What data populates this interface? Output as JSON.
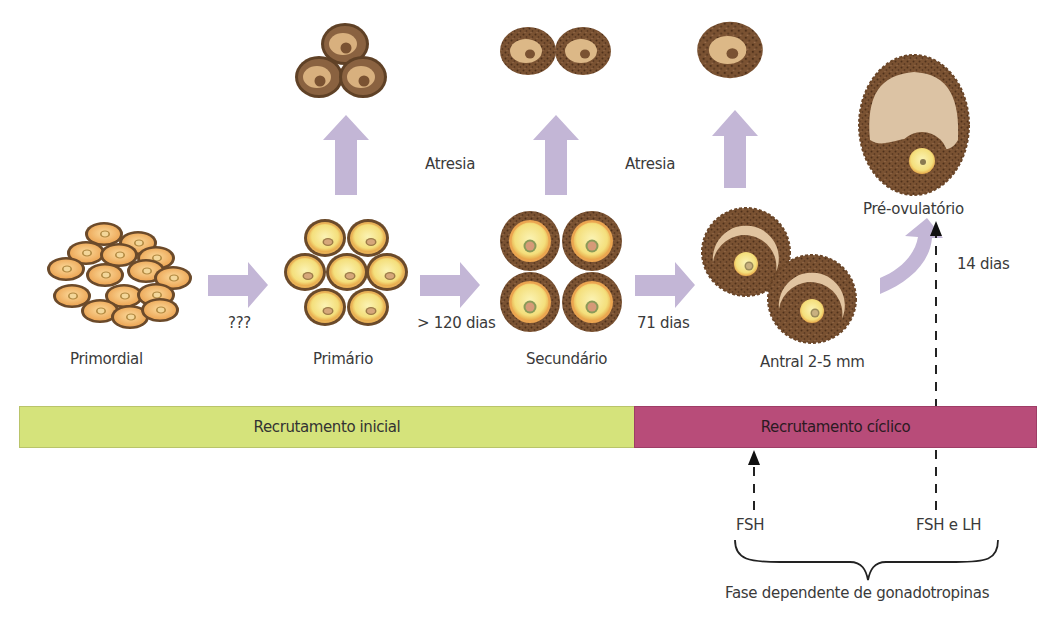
{
  "stages": [
    {
      "id": "primordial",
      "label": "Primordial"
    },
    {
      "id": "primario",
      "label": "Primário"
    },
    {
      "id": "secundario",
      "label": "Secundário"
    },
    {
      "id": "antral",
      "label": "Antral 2-5 mm"
    },
    {
      "id": "pre_ovulatorio",
      "label": "Pré-ovulatório"
    }
  ],
  "transitions": [
    {
      "from": "primordial",
      "to": "primario",
      "label": "???"
    },
    {
      "from": "primario",
      "to": "secundario",
      "label": "> 120 dias"
    },
    {
      "from": "secundario",
      "to": "antral",
      "label": "71 dias"
    },
    {
      "from": "antral",
      "to": "pre_ovulatorio",
      "label": "14 dias"
    }
  ],
  "atresia": [
    {
      "label": "Atresia"
    },
    {
      "label": "Atresia"
    }
  ],
  "timeline": {
    "initial": {
      "label": "Recrutamento inicial",
      "color": "#d5e37b"
    },
    "cyclic": {
      "label": "Recrutamento cíclico",
      "color": "#b84c79"
    }
  },
  "hormones": {
    "fsh": "FSH",
    "fsh_lh": "FSH e LH",
    "phase_label": "Fase dependente de gonadotropinas"
  },
  "colors": {
    "arrow": "#c3b6d6",
    "follicle_outer": "#6e4a2c",
    "oocyte_yellow": "#f5e28a",
    "antrum": "#e0c8a8"
  }
}
